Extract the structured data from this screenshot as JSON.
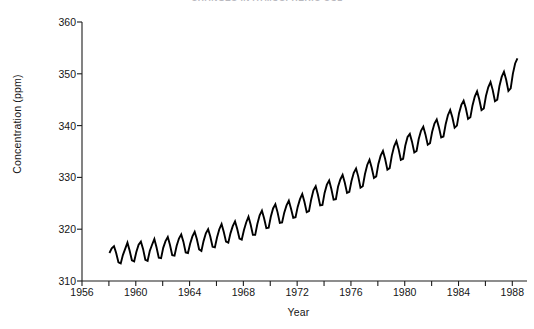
{
  "chart_data": {
    "type": "line",
    "title": "CHANGES IN ATMOSPHERIC CO2",
    "subtitle": "",
    "xlabel": "Year",
    "ylabel": "Concentration  (ppm)",
    "xlim": [
      1956,
      1988.2
    ],
    "ylim": [
      310,
      360
    ],
    "ytick_step": 10,
    "xtick_step": 2,
    "xtick_label_step": 4,
    "grid": false,
    "legend": null,
    "legend_position": "none",
    "line_color": "#000000",
    "line_width": 1.9,
    "annotations": [],
    "ytick_labels": [
      "310",
      "320",
      "330",
      "340",
      "350",
      "360"
    ],
    "ytick_values": [
      310,
      320,
      330,
      340,
      350,
      360
    ],
    "xtick_values": [
      1956,
      1958,
      1960,
      1962,
      1964,
      1966,
      1968,
      1970,
      1972,
      1974,
      1976,
      1978,
      1980,
      1982,
      1984,
      1986,
      1988
    ],
    "xtick_labels": [
      "1956",
      "",
      "1960",
      "",
      "1964",
      "",
      "1968",
      "",
      "1972",
      "",
      "1976",
      "",
      "1980",
      "",
      "1984",
      "",
      "1988"
    ],
    "series": [
      {
        "name": "Atmospheric CO2 concentration (Mauna Loa)",
        "x": [
          1958.04,
          1958.21,
          1958.38,
          1958.54,
          1958.71,
          1958.88,
          1959.04,
          1959.21,
          1959.38,
          1959.54,
          1959.71,
          1959.88,
          1960.04,
          1960.21,
          1960.38,
          1960.54,
          1960.71,
          1960.88,
          1961.04,
          1961.21,
          1961.38,
          1961.54,
          1961.71,
          1961.88,
          1962.04,
          1962.21,
          1962.38,
          1962.54,
          1962.71,
          1962.88,
          1963.04,
          1963.21,
          1963.38,
          1963.54,
          1963.71,
          1963.88,
          1964.04,
          1964.21,
          1964.38,
          1964.54,
          1964.71,
          1964.88,
          1965.04,
          1965.21,
          1965.38,
          1965.54,
          1965.71,
          1965.88,
          1966.04,
          1966.21,
          1966.38,
          1966.54,
          1966.71,
          1966.88,
          1967.04,
          1967.21,
          1967.38,
          1967.54,
          1967.71,
          1967.88,
          1968.04,
          1968.21,
          1968.38,
          1968.54,
          1968.71,
          1968.88,
          1969.04,
          1969.21,
          1969.38,
          1969.54,
          1969.71,
          1969.88,
          1970.04,
          1970.21,
          1970.38,
          1970.54,
          1970.71,
          1970.88,
          1971.04,
          1971.21,
          1971.38,
          1971.54,
          1971.71,
          1971.88,
          1972.04,
          1972.21,
          1972.38,
          1972.54,
          1972.71,
          1972.88,
          1973.04,
          1973.21,
          1973.38,
          1973.54,
          1973.71,
          1973.88,
          1974.04,
          1974.21,
          1974.38,
          1974.54,
          1974.71,
          1974.88,
          1975.04,
          1975.21,
          1975.38,
          1975.54,
          1975.71,
          1975.88,
          1976.04,
          1976.21,
          1976.38,
          1976.54,
          1976.71,
          1976.88,
          1977.04,
          1977.21,
          1977.38,
          1977.54,
          1977.71,
          1977.88,
          1978.04,
          1978.21,
          1978.38,
          1978.54,
          1978.71,
          1978.88,
          1979.04,
          1979.21,
          1979.38,
          1979.54,
          1979.71,
          1979.88,
          1980.04,
          1980.21,
          1980.38,
          1980.54,
          1980.71,
          1980.88,
          1981.04,
          1981.21,
          1981.38,
          1981.54,
          1981.71,
          1981.88,
          1982.04,
          1982.21,
          1982.38,
          1982.54,
          1982.71,
          1982.88,
          1983.04,
          1983.21,
          1983.38,
          1983.54,
          1983.71,
          1983.88,
          1984.04,
          1984.21,
          1984.38,
          1984.54,
          1984.71,
          1984.88,
          1985.04,
          1985.21,
          1985.38,
          1985.54,
          1985.71,
          1985.88,
          1986.04,
          1986.21,
          1986.38,
          1986.54,
          1986.71,
          1986.88,
          1987.04,
          1987.21,
          1987.38,
          1987.54,
          1987.71,
          1987.88,
          1988.04,
          1988.21,
          1988.38
        ],
        "y": [
          315.4,
          316.3,
          316.7,
          315.4,
          313.6,
          313.4,
          315.0,
          316.2,
          317.4,
          315.9,
          314.0,
          313.8,
          315.6,
          317.0,
          317.6,
          316.2,
          314.1,
          313.9,
          315.8,
          317.0,
          318.1,
          316.5,
          314.5,
          314.4,
          316.4,
          317.7,
          318.5,
          317.0,
          315.0,
          314.9,
          316.8,
          318.2,
          319.0,
          317.6,
          315.5,
          315.4,
          317.2,
          318.6,
          319.5,
          318.1,
          316.1,
          315.8,
          317.7,
          319.2,
          320.0,
          318.6,
          316.6,
          316.5,
          318.4,
          320.0,
          321.0,
          319.5,
          317.6,
          317.4,
          319.2,
          320.6,
          321.5,
          320.1,
          318.2,
          318.0,
          319.8,
          321.3,
          322.4,
          320.9,
          318.9,
          318.9,
          321.0,
          322.7,
          323.6,
          322.1,
          320.2,
          320.3,
          322.4,
          324.0,
          324.8,
          323.3,
          321.2,
          321.3,
          323.2,
          324.6,
          325.5,
          324.0,
          322.2,
          322.3,
          324.3,
          325.8,
          326.8,
          325.3,
          323.3,
          323.5,
          325.7,
          327.5,
          328.3,
          326.7,
          324.6,
          324.7,
          327.0,
          328.6,
          329.4,
          327.8,
          325.7,
          325.8,
          328.2,
          329.6,
          330.5,
          329.0,
          327.0,
          327.2,
          329.3,
          330.9,
          331.7,
          330.2,
          328.0,
          328.3,
          330.6,
          332.4,
          333.4,
          331.9,
          329.9,
          330.2,
          332.6,
          334.2,
          335.1,
          333.6,
          331.5,
          331.8,
          334.2,
          336.0,
          337.0,
          335.5,
          333.4,
          333.6,
          336.1,
          337.8,
          338.4,
          336.9,
          334.8,
          335.1,
          337.4,
          339.0,
          339.8,
          338.3,
          336.3,
          336.6,
          338.8,
          340.4,
          341.2,
          339.7,
          337.7,
          337.9,
          340.2,
          342.0,
          343.0,
          341.6,
          339.6,
          340.0,
          342.4,
          344.0,
          344.8,
          343.4,
          341.3,
          341.6,
          343.9,
          345.6,
          346.6,
          345.1,
          343.0,
          343.3,
          345.7,
          347.4,
          348.4,
          346.9,
          344.7,
          345.0,
          347.6,
          349.4,
          350.4,
          348.9,
          346.7,
          347.2,
          350.0,
          352.0,
          353.0
        ],
        "y_max_observed": 355.5,
        "y_min_observed": 313.4,
        "start_value": 315.4,
        "end_value": 351.3
      }
    ]
  },
  "axes": {
    "y_axis_name": "concentration-axis",
    "x_axis_name": "year-axis"
  }
}
